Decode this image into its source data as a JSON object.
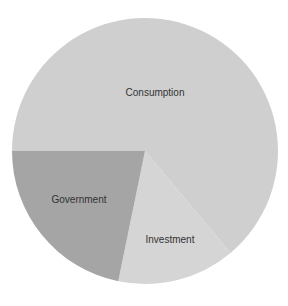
{
  "chart_data": {
    "type": "pie",
    "title": "",
    "categories": [
      "Consumption",
      "Investment",
      "Government"
    ],
    "values": [
      64,
      14,
      22
    ],
    "unit": "percent (estimated from slice angles)",
    "colors": [
      "#cfcfcf",
      "#d5d5d5",
      "#a5a5a5"
    ],
    "legend": "none (labels inside slices)",
    "slices": [
      {
        "label": "Consumption",
        "value": 64,
        "color": "#cfcfcf",
        "start_deg": 180,
        "end_deg": 410,
        "label_x": 155,
        "label_y": 93
      },
      {
        "label": "Investment",
        "value": 14,
        "color": "#d5d5d5",
        "start_deg": 50,
        "end_deg": 101.6,
        "label_x": 170,
        "label_y": 240
      },
      {
        "label": "Government",
        "value": 22,
        "color": "#a5a5a5",
        "start_deg": 101.6,
        "end_deg": 180,
        "label_x": 79,
        "label_y": 200
      }
    ]
  },
  "geometry": {
    "cx": 145,
    "cy": 151,
    "r": 133
  },
  "labels": {
    "consumption": "Consumption",
    "investment": "Investment",
    "government": "Government"
  }
}
